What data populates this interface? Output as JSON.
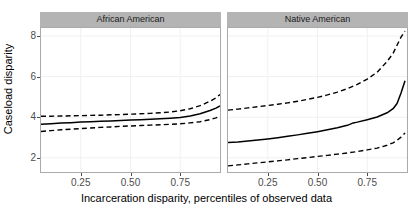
{
  "chart_data": {
    "type": "line",
    "title": "",
    "xlabel": "Incarceration disparity, percentiles of observed data",
    "ylabel": "Caseload disparity",
    "xlim": [
      0.05,
      0.95
    ],
    "ylim": [
      1.3,
      8.4
    ],
    "xticks": [
      0.25,
      0.5,
      0.75
    ],
    "xtick_labels": [
      "0.25",
      "0.50",
      "0.75"
    ],
    "yticks": [
      2,
      4,
      6,
      8
    ],
    "ytick_labels": [
      "2",
      "4",
      "6",
      "8"
    ],
    "grid": true,
    "legend": "none",
    "facets": [
      {
        "label": "African American",
        "x": [
          0.05,
          0.1,
          0.15,
          0.2,
          0.25,
          0.3,
          0.35,
          0.4,
          0.45,
          0.5,
          0.55,
          0.6,
          0.65,
          0.7,
          0.75,
          0.8,
          0.85,
          0.9,
          0.93,
          0.95
        ],
        "series": [
          {
            "name": "estimate",
            "style": "solid",
            "values": [
              3.65,
              3.68,
              3.71,
              3.73,
              3.76,
              3.78,
              3.8,
              3.82,
              3.84,
              3.86,
              3.88,
              3.9,
              3.92,
              3.95,
              3.99,
              4.06,
              4.17,
              4.33,
              4.45,
              4.56
            ]
          },
          {
            "name": "upper confidence limit",
            "style": "dashed",
            "values": [
              4.05,
              4.05,
              4.06,
              4.07,
              4.08,
              4.09,
              4.1,
              4.12,
              4.13,
              4.15,
              4.17,
              4.19,
              4.22,
              4.26,
              4.32,
              4.42,
              4.57,
              4.79,
              4.96,
              5.12
            ]
          },
          {
            "name": "lower confidence limit",
            "style": "dashed",
            "values": [
              3.3,
              3.34,
              3.38,
              3.41,
              3.44,
              3.47,
              3.5,
              3.52,
              3.55,
              3.57,
              3.59,
              3.61,
              3.63,
              3.65,
              3.68,
              3.72,
              3.78,
              3.88,
              3.97,
              4.05
            ]
          }
        ]
      },
      {
        "label": "Native American",
        "x": [
          0.05,
          0.1,
          0.15,
          0.2,
          0.25,
          0.3,
          0.35,
          0.4,
          0.45,
          0.5,
          0.55,
          0.6,
          0.65,
          0.68,
          0.7,
          0.75,
          0.8,
          0.85,
          0.88,
          0.9,
          0.92,
          0.94
        ],
        "series": [
          {
            "name": "estimate",
            "style": "solid",
            "values": [
              2.75,
              2.78,
              2.83,
              2.88,
              2.93,
              2.99,
              3.06,
              3.13,
              3.21,
              3.29,
              3.38,
              3.48,
              3.6,
              3.72,
              3.76,
              3.88,
              4.01,
              4.22,
              4.42,
              4.68,
              5.2,
              5.8
            ]
          },
          {
            "name": "upper confidence limit",
            "style": "dashed",
            "values": [
              4.35,
              4.4,
              4.46,
              4.52,
              4.58,
              4.64,
              4.71,
              4.79,
              4.88,
              4.98,
              5.1,
              5.24,
              5.41,
              5.54,
              5.62,
              5.88,
              6.22,
              6.75,
              7.15,
              7.55,
              7.95,
              8.25
            ]
          },
          {
            "name": "lower confidence limit",
            "style": "dashed",
            "values": [
              1.6,
              1.65,
              1.7,
              1.75,
              1.8,
              1.85,
              1.9,
              1.96,
              2.01,
              2.07,
              2.12,
              2.18,
              2.24,
              2.28,
              2.31,
              2.39,
              2.48,
              2.62,
              2.74,
              2.86,
              3.02,
              3.22
            ]
          }
        ]
      }
    ]
  },
  "axes": {
    "ylabel": "Caseload disparity",
    "xlabel": "Incarceration disparity, percentiles of observed data",
    "ytick_labels": [
      "8",
      "6",
      "4",
      "2"
    ],
    "xtick_labels": [
      "0.25",
      "0.50",
      "0.75"
    ]
  },
  "panels": [
    {
      "label": "African American"
    },
    {
      "label": "Native American"
    }
  ],
  "colors": {
    "strip_background": "#b4b4b4",
    "line": "#000000",
    "panel_border": "#aaaaaa",
    "grid": "#f0f0f0",
    "axis_text": "#4d4d4d",
    "background": "#ffffff"
  }
}
